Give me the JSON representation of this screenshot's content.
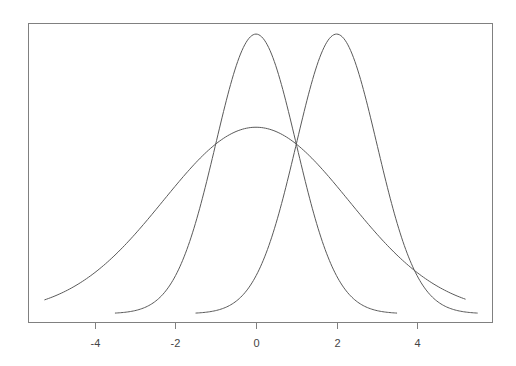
{
  "chart_data": {
    "type": "line",
    "title": "",
    "xlabel": "",
    "ylabel": "",
    "xlim": [
      -5.45,
      5.6
    ],
    "ylim": [
      0,
      0.415
    ],
    "grid": false,
    "legend": null,
    "x_ticks": [
      -4,
      -2,
      0,
      2,
      4
    ],
    "x_tick_labels": [
      "-4",
      "-2",
      "0",
      "2",
      "4"
    ],
    "y_axis_shown": false,
    "colors": {
      "line": "#5a5a5a",
      "frame": "#808080",
      "tick_text": "#444444"
    },
    "series": [
      {
        "name": "normal mean 0 sd 1",
        "kind": "gaussian",
        "mean": 0,
        "sd": 1,
        "peak": 0.3989,
        "x_range": [
          -3.5,
          3.5
        ]
      },
      {
        "name": "normal mean 2 sd 1",
        "kind": "gaussian",
        "mean": 2,
        "sd": 1,
        "peak": 0.3989,
        "x_range": [
          -1.5,
          5.5
        ]
      },
      {
        "name": "wide curve centered 0",
        "kind": "gaussian",
        "mean": 0,
        "sd": 2.3,
        "peak": 0.266,
        "x_range": [
          -5.25,
          5.2
        ]
      }
    ]
  },
  "layout": {
    "frame": {
      "left": 28,
      "top": 23,
      "right": 492,
      "bottom": 322
    },
    "x_origin_px": 256,
    "px_per_x_unit": 40.3,
    "y_zero_px": 313.7,
    "px_per_y_unit": 701,
    "tick_length": 7,
    "tick_label_y": 347
  }
}
